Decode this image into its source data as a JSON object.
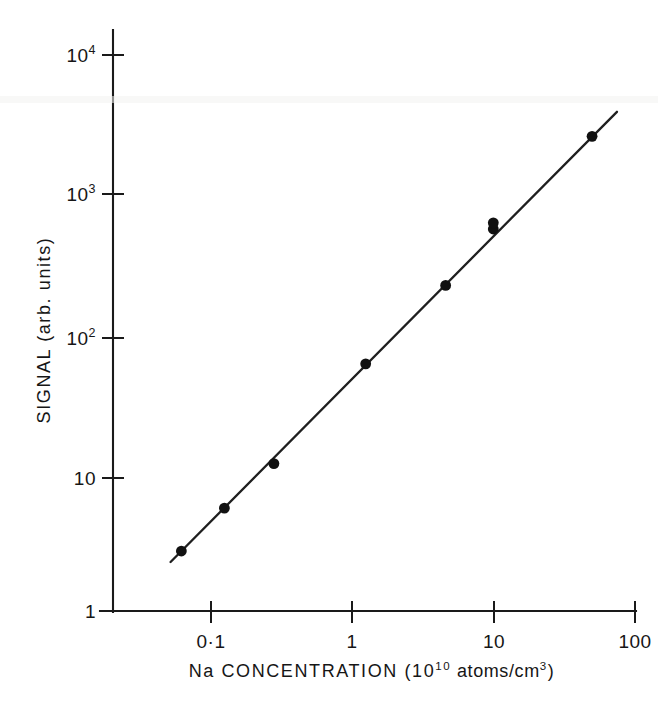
{
  "chart_data": {
    "type": "scatter",
    "title": "",
    "xlabel": "Na CONCENTRATION (10^10 atoms/cm^3)",
    "ylabel": "SIGNAL (arb. units)",
    "xscale": "log",
    "yscale": "log",
    "xlim": [
      0.045,
      100
    ],
    "ylim": [
      1,
      10000
    ],
    "grid": false,
    "legend": null,
    "x": [
      0.062,
      0.125,
      0.28,
      1.25,
      4.6,
      10.0,
      10.0,
      50.0
    ],
    "y": [
      2.7,
      5.5,
      11.5,
      60,
      220,
      560,
      620,
      2600
    ],
    "series": [
      {
        "name": "Na signal calibration",
        "points": [
          {
            "x": 0.062,
            "y": 2.7
          },
          {
            "x": 0.125,
            "y": 5.5
          },
          {
            "x": 0.28,
            "y": 11.5
          },
          {
            "x": 1.25,
            "y": 60
          },
          {
            "x": 4.6,
            "y": 220
          },
          {
            "x": 10.0,
            "y": 560
          },
          {
            "x": 10.0,
            "y": 620
          },
          {
            "x": 50.0,
            "y": 2600
          }
        ]
      }
    ],
    "fit_line": {
      "x_start": 0.052,
      "y_start": 2.25,
      "x_end": 75,
      "y_end": 3900,
      "slope": 1.0
    },
    "annotations": []
  },
  "axes": {
    "y_ticks": [
      {
        "label_base": "10",
        "label_exp": "4",
        "value": 10000
      },
      {
        "label_base": "10",
        "label_exp": "3",
        "value": 1000
      },
      {
        "label_base": "10",
        "label_exp": "2",
        "value": 100
      },
      {
        "label_base": "10",
        "label_exp": "",
        "value": 10
      },
      {
        "label_base": "1",
        "label_exp": "",
        "value": 1
      }
    ],
    "x_ticks": [
      {
        "label": "0·1",
        "value": 0.1
      },
      {
        "label": "1",
        "value": 1
      },
      {
        "label": "10",
        "value": 10
      },
      {
        "label": "100",
        "value": 100
      }
    ],
    "x_title_parts": {
      "lead": "Na  CONCENTRATION   (10",
      "sup1": "10",
      "mid": " atoms/cm",
      "sup2": "3",
      "tail": ")"
    },
    "y_title": "SIGNAL  (arb. units)"
  },
  "colors": {
    "ink": "#1a1a1a",
    "marker": "#111111",
    "background": "#ffffff"
  }
}
